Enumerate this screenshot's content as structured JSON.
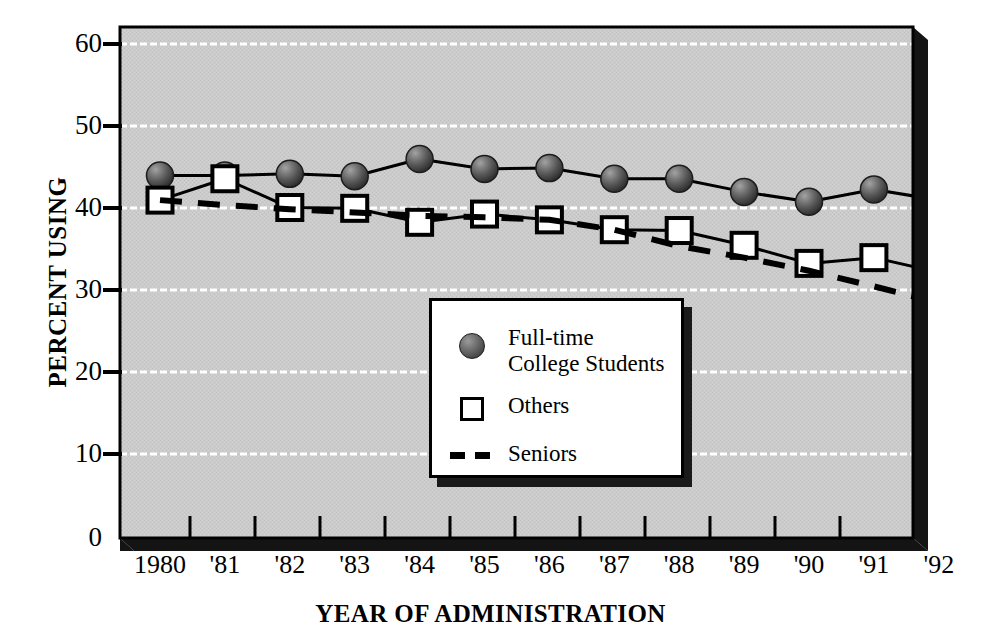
{
  "chart_data": {
    "type": "line",
    "title": "",
    "xlabel": "YEAR OF ADMINISTRATION",
    "ylabel": "PERCENT USING",
    "x": [
      1980,
      1981,
      1982,
      1983,
      1984,
      1985,
      1986,
      1987,
      1988,
      1989,
      1990,
      1991,
      1992
    ],
    "categories": [
      "1980",
      "'81",
      "'82",
      "'83",
      "'84",
      "'85",
      "'86",
      "'87",
      "'88",
      "'89",
      "'90",
      "'91",
      "'92"
    ],
    "xtick_labels": [
      "1980",
      "'81",
      "'82",
      "'83",
      "'84",
      "'85",
      "'86",
      "'87",
      "'88",
      "'89",
      "'90",
      "'91",
      "'92"
    ],
    "ytick_labels": [
      "60",
      "50",
      "40",
      "30",
      "20",
      "10",
      "0"
    ],
    "yticks": [
      60,
      50,
      40,
      30,
      20,
      10,
      0
    ],
    "ylim": [
      0,
      62
    ],
    "xlim": [
      1979.3,
      1992.7
    ],
    "grid": "horizontal-white",
    "legend_position": "lower-center",
    "series": [
      {
        "name": "Full-time College Students",
        "marker": "filled-circle",
        "line": "solid",
        "values": [
          44.0,
          44.0,
          44.2,
          43.9,
          46.0,
          44.8,
          44.9,
          43.6,
          43.6,
          42.0,
          40.8,
          42.3,
          41.0
        ]
      },
      {
        "name": "Others",
        "marker": "open-square",
        "line": "solid",
        "values": [
          41.0,
          43.6,
          40.1,
          40.0,
          38.3,
          39.3,
          38.6,
          37.4,
          37.3,
          35.5,
          33.3,
          34.0,
          32.2
        ]
      },
      {
        "name": "Seniors",
        "marker": "none",
        "line": "dashed",
        "values": [
          41.0,
          40.4,
          39.9,
          39.5,
          39.1,
          38.9,
          38.6,
          37.4,
          35.4,
          34.0,
          32.4,
          30.5,
          28.5
        ]
      }
    ]
  },
  "axes": {
    "ylabel": "PERCENT USING",
    "xlabel": "YEAR OF ADMINISTRATION",
    "ytick_labels": [
      "60",
      "50",
      "40",
      "30",
      "20",
      "10",
      "0"
    ],
    "xtick_labels": [
      "1980",
      "'81",
      "'82",
      "'83",
      "'84",
      "'85",
      "'86",
      "'87",
      "'88",
      "'89",
      "'90",
      "'91",
      "'92"
    ]
  },
  "legend": {
    "items": [
      {
        "label": "Full-time\nCollege Students",
        "marker": "filled-circle"
      },
      {
        "label": "Others",
        "marker": "open-square"
      },
      {
        "label": "Seniors",
        "marker": "dashed-line"
      }
    ]
  },
  "colors": {
    "plot_background": "#c9c9c9",
    "gridline": "#ffffff",
    "axis": "#000000",
    "shadow": "#1a1a1a",
    "marker_circle": "#595959",
    "marker_square_fill": "#ffffff"
  }
}
